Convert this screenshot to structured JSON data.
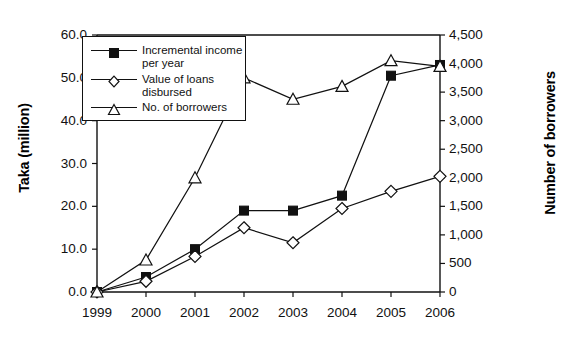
{
  "chart_data": {
    "type": "line",
    "title": "",
    "xlabel": "",
    "ylabel": "Taka (million)",
    "y2label": "Number of borrowers",
    "categories": [
      "1999",
      "2000",
      "2001",
      "2002",
      "2003",
      "2004",
      "2005",
      "2006"
    ],
    "ylim": [
      0,
      60
    ],
    "y2lim": [
      0,
      4500
    ],
    "yticks": [
      "0.0",
      "10.0",
      "20.0",
      "30.0",
      "40.0",
      "50.0",
      "60.0"
    ],
    "ytick_values": [
      0,
      10,
      20,
      30,
      40,
      50,
      60
    ],
    "y2ticks": [
      "0",
      "500",
      "1,000",
      "1,500",
      "2,000",
      "2,500",
      "3,000",
      "3,500",
      "4,000",
      "4,500"
    ],
    "y2tick_values": [
      0,
      500,
      1000,
      1500,
      2000,
      2500,
      3000,
      3500,
      4000,
      4500
    ],
    "grid": false,
    "legend_position": "top-left",
    "series": [
      {
        "name": "Incremental income per year",
        "legend_label": "Incremental income\nper year",
        "marker": "filled-square",
        "axis": "left",
        "values": [
          0,
          3.5,
          10.0,
          19.0,
          19.0,
          22.5,
          50.5,
          53.0
        ]
      },
      {
        "name": "Value of loans disbursed",
        "legend_label": "Value of loans\ndisbursed",
        "marker": "open-diamond",
        "axis": "left",
        "values": [
          0,
          2.5,
          8.3,
          15.0,
          11.5,
          19.5,
          23.5,
          27.0
        ]
      },
      {
        "name": "No. of borrowers",
        "legend_label": "No. of borrowers",
        "marker": "open-triangle",
        "axis": "right",
        "values": [
          0,
          560,
          2000,
          3750,
          3375,
          3600,
          4050,
          3950
        ]
      }
    ]
  },
  "colors": {
    "line": "#111111",
    "marker_fill": "#111111",
    "marker_open": "#ffffff",
    "background": "#ffffff"
  }
}
